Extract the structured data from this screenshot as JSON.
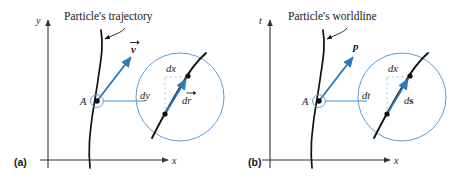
{
  "figure": {
    "background_color": "#ffffff",
    "curve_color": "#111111",
    "accent_color": "#2e7ab8",
    "inset_circle_color": "#5b9bd5",
    "leader_color": "#7fb3de",
    "axis_color": "#333333",
    "dashed_color": "#9ec8e8"
  },
  "panels": [
    {
      "key": "a",
      "label": "(a)",
      "title": "Particle's trajectory",
      "axis_vertical": "y",
      "axis_horizontal": "x",
      "point_label": "A",
      "vector_label": "v",
      "vector_label_style": "arrow-over",
      "inset": {
        "horizontal_component": "dx",
        "vertical_component": "dy",
        "displacement_label": "dr",
        "displacement_style": "arrow-over"
      }
    },
    {
      "key": "b",
      "label": "(b)",
      "title": "Particle's worldline",
      "axis_vertical": "t",
      "axis_horizontal": "x",
      "point_label": "A",
      "vector_label": "p",
      "vector_label_style": "bold-italic",
      "inset": {
        "horizontal_component": "dx",
        "vertical_component": "dt",
        "displacement_label": "ds",
        "displacement_style": "bold-upright-s"
      }
    }
  ]
}
